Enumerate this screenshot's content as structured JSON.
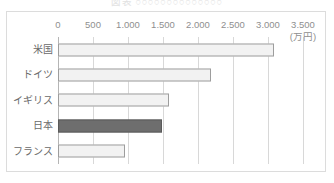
{
  "title": {
    "text": "図表  ○○○○○○○○○○○○○○",
    "visible": "partially-cropped"
  },
  "chart_data": {
    "type": "bar",
    "orientation": "horizontal",
    "title": "",
    "categories": [
      "米国",
      "ドイツ",
      "イギリス",
      "日本",
      "フランス"
    ],
    "values": [
      3090,
      2180,
      1580,
      1480,
      950
    ],
    "highlight_category": "日本",
    "xlabel": "",
    "ylabel": "",
    "unit_label": "(万円)",
    "xlim": [
      0,
      3500
    ],
    "xticks": [
      0,
      500,
      1000,
      1500,
      2000,
      2500,
      3000,
      3500
    ],
    "xtick_labels": [
      "0",
      "500",
      "1.000",
      "1.500",
      "2.000",
      "2.500",
      "3.000",
      "3.500"
    ],
    "grid": "vertical",
    "legend": "none",
    "colors": {
      "bar_fill": "#f2f2f2",
      "bar_stroke": "#9d9d9d",
      "highlight_fill": "#6e6e6e",
      "highlight_stroke": "#5a5a5a",
      "gridline": "#d8d8d8",
      "axis": "#b5b5b5",
      "frame": "#dcdcdc",
      "text": "#6a6a6a",
      "background": "#ffffff"
    }
  }
}
